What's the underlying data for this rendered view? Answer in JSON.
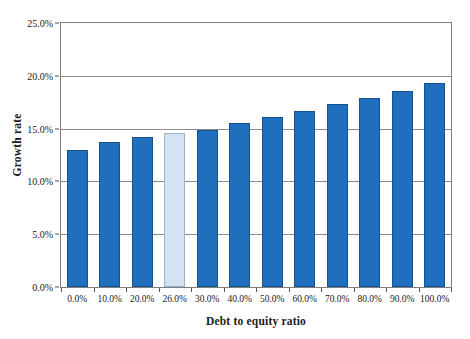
{
  "chart_data": {
    "type": "bar",
    "title": "",
    "xlabel": "Debt to equity ratio",
    "ylabel": "Growth rate",
    "categories": [
      "0.0%",
      "10.0%",
      "20.0%",
      "26.0%",
      "30.0%",
      "40.0%",
      "50.0%",
      "60.0%",
      "70.0%",
      "80.0%",
      "90.0%",
      "100.0%"
    ],
    "values": [
      13.0,
      13.7,
      14.2,
      14.6,
      14.9,
      15.5,
      16.1,
      16.7,
      17.3,
      17.9,
      18.6,
      19.3
    ],
    "highlighted_index": 3,
    "ylim": [
      0,
      25
    ],
    "yticks": [
      0,
      5,
      10,
      15,
      20,
      25
    ],
    "ytick_labels": [
      "0.0%",
      "5.0%",
      "10.0%",
      "15.0%",
      "20.0%",
      "25.0%"
    ],
    "grid": true,
    "legend": "none",
    "colors": {
      "bar": "#1f6fbe",
      "bar_border": "#16528e",
      "highlight_bar": "#d4e3f1",
      "highlight_bar_border": "#9cb3c7",
      "gridline": "#8c8c8c",
      "plot_border": "#7d7d7d",
      "text": "#1a1a1a",
      "background": "#ffffff"
    }
  }
}
